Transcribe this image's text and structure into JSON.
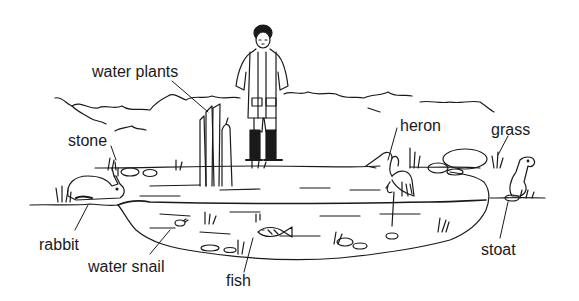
{
  "diagram": {
    "title": "",
    "type": "labelled pond habitat illustration",
    "ink_color": "#1a1a1a",
    "background_color": "#ffffff",
    "labels": [
      {
        "id": "water-plants",
        "text": "water plants",
        "x": 92,
        "y": 64
      },
      {
        "id": "stone",
        "text": "stone",
        "x": 68,
        "y": 133
      },
      {
        "id": "heron",
        "text": "heron",
        "x": 400,
        "y": 118
      },
      {
        "id": "grass",
        "text": "grass",
        "x": 491,
        "y": 122
      },
      {
        "id": "rabbit",
        "text": "rabbit",
        "x": 39,
        "y": 237
      },
      {
        "id": "water-snail",
        "text": "water snail",
        "x": 88,
        "y": 260
      },
      {
        "id": "fish",
        "text": "fish",
        "x": 226,
        "y": 273
      },
      {
        "id": "stoat",
        "text": "stoat",
        "x": 481,
        "y": 242
      }
    ]
  }
}
